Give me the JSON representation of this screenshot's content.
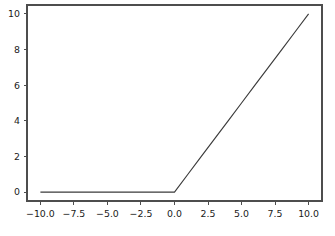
{
  "chart_data": {
    "type": "line",
    "title": "",
    "xlabel": "",
    "ylabel": "",
    "xlim": [
      -11.0,
      11.0
    ],
    "ylim": [
      -0.5,
      10.5
    ],
    "grid": false,
    "legend": null,
    "xticks": [
      -10.0,
      -7.5,
      -5.0,
      -2.5,
      0.0,
      2.5,
      5.0,
      7.5,
      10.0
    ],
    "xticklabels": [
      "−10.0",
      "−7.5",
      "−5.0",
      "−2.5",
      "0.0",
      "2.5",
      "5.0",
      "7.5",
      "10.0"
    ],
    "yticks": [
      0,
      2,
      4,
      6,
      8,
      10
    ],
    "yticklabels": [
      "0",
      "2",
      "4",
      "6",
      "8",
      "10"
    ],
    "series": [
      {
        "name": "relu",
        "color": "#3b3b3b",
        "linewidth": 1.15,
        "x": [
          -10.0,
          -9.0,
          -8.0,
          -7.0,
          -6.0,
          -5.0,
          -4.0,
          -3.0,
          -2.0,
          -1.0,
          0.0,
          1.0,
          2.0,
          3.0,
          4.0,
          5.0,
          6.0,
          7.0,
          8.0,
          9.0,
          10.0
        ],
        "y": [
          0.0,
          0.0,
          0.0,
          0.0,
          0.0,
          0.0,
          0.0,
          0.0,
          0.0,
          0.0,
          0.0,
          1.0,
          2.0,
          3.0,
          4.0,
          5.0,
          6.0,
          7.0,
          8.0,
          9.0,
          10.0
        ]
      }
    ]
  },
  "axes": {
    "spine_color": "#4d4d4d",
    "background_color": "#ffffff",
    "tick_label_color": "#1a1a1a"
  }
}
